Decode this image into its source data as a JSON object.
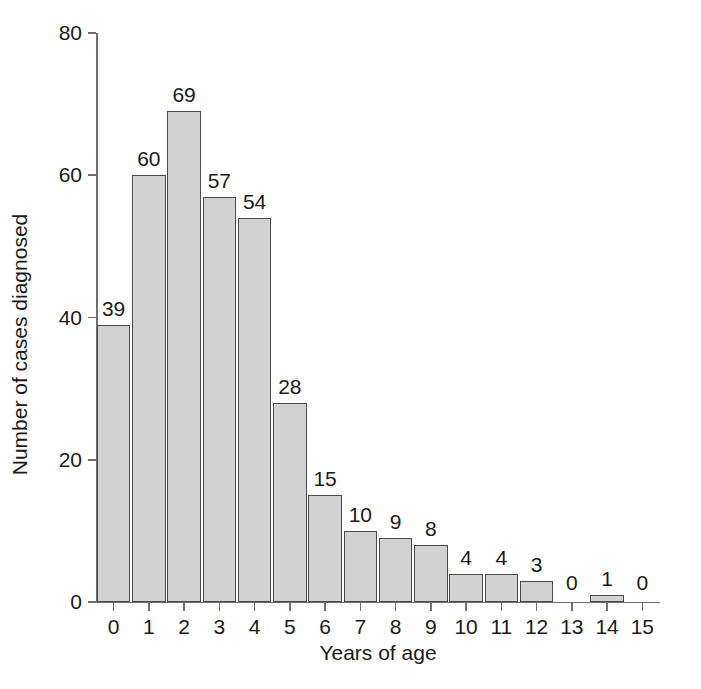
{
  "chart_data": {
    "type": "bar",
    "title": "",
    "xlabel": "Years of age",
    "ylabel": "Number of cases diagnosed",
    "categories": [
      "0",
      "1",
      "2",
      "3",
      "4",
      "5",
      "6",
      "7",
      "8",
      "9",
      "10",
      "11",
      "12",
      "13",
      "14",
      "15"
    ],
    "values": [
      39,
      60,
      69,
      57,
      54,
      28,
      15,
      10,
      9,
      8,
      4,
      4,
      3,
      0,
      1,
      0
    ],
    "data_labels": [
      "39",
      "60",
      "69",
      "57",
      "54",
      "28",
      "15",
      "10",
      "9",
      "8",
      "4",
      "4",
      "3",
      "0",
      "1",
      "0"
    ],
    "xlim": [
      -0.5,
      15.5
    ],
    "ylim": [
      0,
      80
    ],
    "y_ticks": [
      0,
      20,
      40,
      60,
      80
    ],
    "y_tick_labels": [
      "0",
      "20",
      "40",
      "60",
      "80"
    ],
    "x_tick_labels": [
      "0",
      "1",
      "2",
      "3",
      "4",
      "5",
      "6",
      "7",
      "8",
      "9",
      "10",
      "11",
      "12",
      "13",
      "14",
      "15"
    ],
    "grid": false,
    "legend": null,
    "bar_fill_color": "#d2d2d2",
    "bar_border_color": "#4a4a4a",
    "axis_color": "#6f6f6f",
    "text_color": "#1a1a1a",
    "background_color": "#ffffff"
  }
}
